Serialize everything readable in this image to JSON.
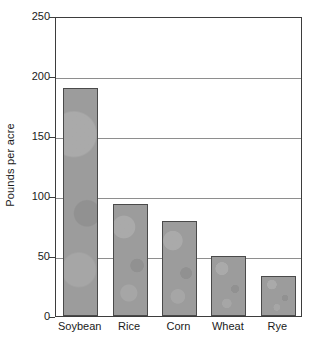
{
  "chart_data": {
    "type": "bar",
    "title": "",
    "subtitle": "",
    "xlabel": "",
    "ylabel": "Pounds per acre",
    "categories": [
      "Soybean",
      "Rice",
      "Corn",
      "Wheat",
      "Rye"
    ],
    "values": [
      190,
      93,
      79,
      50,
      33
    ],
    "ylim": [
      0,
      250
    ],
    "yticks": [
      0,
      50,
      100,
      150,
      200,
      250
    ],
    "ytick_labels": [
      "0",
      "50",
      "100",
      "150",
      "200",
      "250"
    ],
    "grid": "horizontal",
    "legend": "none",
    "annotations": [],
    "colors": {
      "bar_fill": "#9c9c9c",
      "bar_border": "#4a4a4a",
      "gridline": "#8e8e8e",
      "axis": "#3d3d3d",
      "background": "#ffffff",
      "text": "#1a1a1a"
    }
  }
}
